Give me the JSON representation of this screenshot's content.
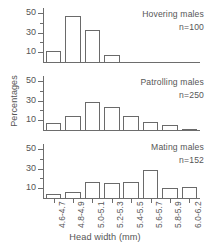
{
  "chart_data": {
    "type": "bar",
    "title": "",
    "xlabel": "Head width (mm)",
    "ylabel": "Percentages",
    "categories": [
      "4.6-4.7",
      "4.8-4.9",
      "5.0-5.1",
      "5.2-5.3",
      "5.4-5.5",
      "5.6-5.7",
      "5.8-5.9",
      "6.0-6.2"
    ],
    "ylim": [
      0,
      55
    ],
    "yticks": [
      10,
      30,
      50
    ],
    "grid": false,
    "legend": "none",
    "panels": [
      {
        "name": "Hovering males",
        "annotation": "Hovering males",
        "n_label": "n=100",
        "n": 100,
        "values": [
          11,
          47,
          33,
          7,
          0,
          0,
          0,
          0
        ]
      },
      {
        "name": "Patrolling males",
        "annotation": "Patrolling males",
        "n_label": "n=250",
        "n": 250,
        "values": [
          7,
          14,
          29,
          23,
          14,
          8,
          5,
          1
        ]
      },
      {
        "name": "Mating males",
        "annotation": "Mating males",
        "n_label": "n=152",
        "n": 152,
        "values": [
          4,
          6,
          16,
          15,
          16,
          29,
          10,
          11
        ]
      }
    ]
  },
  "axis": {
    "ytick_labels": [
      "10",
      "30",
      "50"
    ],
    "xlabel": "Head width (mm)",
    "ylabel": "Percentages"
  }
}
